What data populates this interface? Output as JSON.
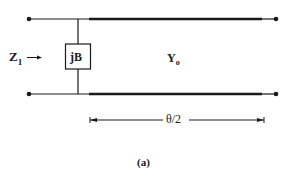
{
  "diagram": {
    "type": "transmission-line-circuit",
    "labels": {
      "input_impedance": "Z",
      "input_impedance_sub": "1",
      "input_arrow": "→",
      "shunt_element": "jB",
      "line_admittance": "Y",
      "line_admittance_sub": "o",
      "length": "θ/2",
      "caption": "(a)"
    },
    "colors": {
      "stroke": "#1a1a1a",
      "background": "#ffffff"
    }
  }
}
